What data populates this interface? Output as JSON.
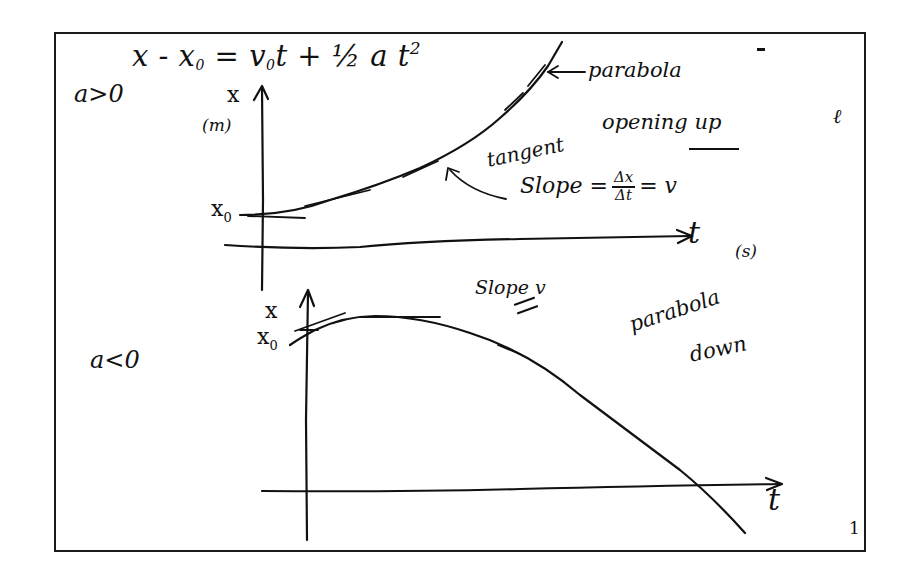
{
  "diagram": {
    "type": "handwritten-physics-notes",
    "topic": "Position vs. time graphs for constant acceleration",
    "equation": {
      "lhs": "x - x",
      "lhs_sub": "0",
      "equals": "=",
      "v": "v",
      "v_sub": "0",
      "rest": "t + ½ a t",
      "power": "2"
    },
    "upper_graph": {
      "condition": "a>0",
      "y_axis_label": "x",
      "y_axis_unit": "(m)",
      "intercept_label": "x",
      "intercept_sub": "0",
      "x_axis_label": "t",
      "x_axis_unit": "(s)",
      "curve_label": "parabola",
      "curve_note": "opening up",
      "tangent_label": "tangent",
      "slope_text": "Slope =",
      "slope_num": "Δx",
      "slope_den": "Δt",
      "slope_result": "= v"
    },
    "lower_graph": {
      "condition": "a<0",
      "y_axis_label": "x",
      "intercept_label": "x",
      "intercept_sub": "0",
      "x_axis_label": "t",
      "slope_note": "Slope = v",
      "slope_note_top": "Slope",
      "slope_note_v": "v",
      "curve_label_1": "parabola",
      "curve_label_2": "down"
    },
    "marks": {
      "dash": "-",
      "stray_mark": "ℓ",
      "page_number": "1"
    },
    "colors": {
      "ink": "#111111",
      "paper": "#ffffff",
      "frame": "#1a1a1a"
    }
  }
}
